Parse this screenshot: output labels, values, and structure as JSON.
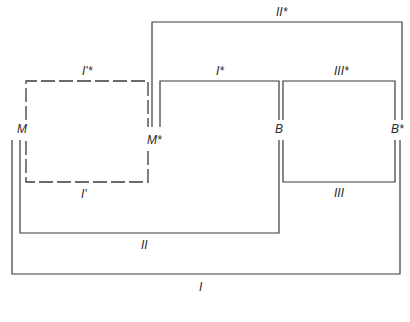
{
  "diagram": {
    "nodes": {
      "M": "M",
      "M_star": "M*",
      "B": "B",
      "B_star": "B*"
    },
    "paths": {
      "I_prime_star": "I'*",
      "I_prime": "I'",
      "I_star": "I*",
      "II_star": "II*",
      "III_star": "III*",
      "III": "III",
      "II": "II",
      "I": "I"
    },
    "colors": {
      "line": "#3a3a3a",
      "text": "#2a2a2a",
      "background": "#ffffff"
    }
  }
}
